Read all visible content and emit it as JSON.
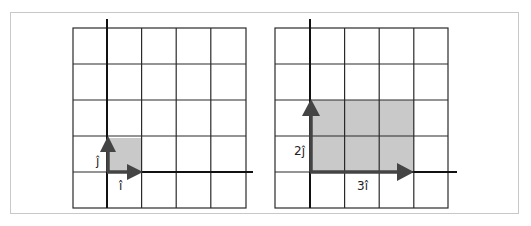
{
  "figure": {
    "colors": {
      "grid": "#2a2a2a",
      "axis": "#111111",
      "vector": "#444444",
      "shade": "#c9c9c9",
      "frame": "#c8c8c8"
    },
    "panels": [
      {
        "id": "left",
        "grid_cells": 5,
        "shaded_area": {
          "width": 1,
          "height": 1
        },
        "vectors": [
          {
            "name": "i-hat",
            "label": "î",
            "x": 1,
            "y": 0
          },
          {
            "name": "j-hat",
            "label": "ĵ",
            "x": 0,
            "y": 1
          }
        ]
      },
      {
        "id": "right",
        "grid_cells": 5,
        "shaded_area": {
          "width": 3,
          "height": 2
        },
        "vectors": [
          {
            "name": "3i-hat",
            "label": "3î",
            "x": 3,
            "y": 0
          },
          {
            "name": "2j-hat",
            "label": "2ĵ",
            "x": 0,
            "y": 2
          }
        ]
      }
    ]
  }
}
